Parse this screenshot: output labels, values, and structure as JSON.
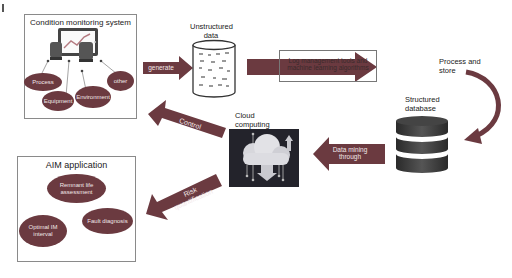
{
  "colors": {
    "arrow": "#6b3a40",
    "ellipse": "#6b3a40",
    "ellipse_text": "#f1e6e7",
    "panel_border": "#8a8a8a",
    "db_dark": "#3a3a3a",
    "cloud_bg": "#23232b"
  },
  "condition_monitoring": {
    "title": "Condition monitoring system",
    "nodes": [
      {
        "label": "Process"
      },
      {
        "label": "Equipment"
      },
      {
        "label": "Environment"
      },
      {
        "label": "other"
      }
    ],
    "icon": "tablet-chart-icon"
  },
  "arrows": {
    "generate": "generate",
    "log_tools": "Log management tools and machine learning algorithms",
    "control": "Control",
    "data_mining": "Data mining through",
    "risk": "Risk quantification"
  },
  "unstructured": {
    "label": "Unstructured data",
    "icon": "cylinder-icon"
  },
  "process_store": {
    "label": "Process and store"
  },
  "structured": {
    "label": "Structured database",
    "icon": "database-icon"
  },
  "cloud": {
    "label": "Cloud computing",
    "icon": "cloud-computing-icon"
  },
  "aim": {
    "title": "AIM application",
    "nodes": [
      {
        "label": "Remnant life assessment"
      },
      {
        "label": "Fault diagnosis"
      },
      {
        "label": "Optimal IM interval"
      }
    ]
  }
}
